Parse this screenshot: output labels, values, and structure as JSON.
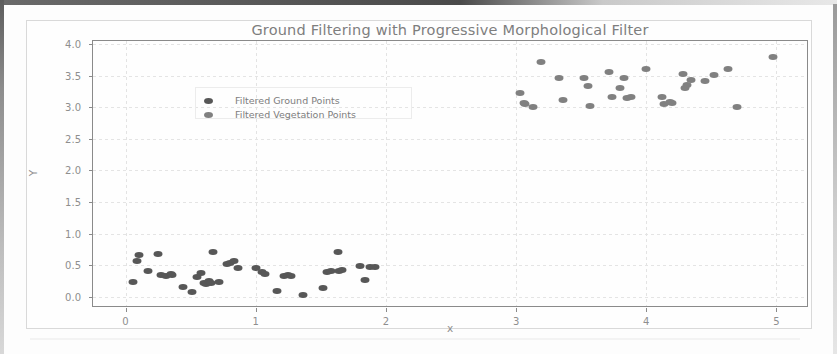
{
  "chart_data": {
    "type": "scatter",
    "title": "Ground Filtering with Progressive Morphological Filter",
    "xlabel": "x",
    "ylabel": "Y",
    "xlim": [
      -0.25,
      5.25
    ],
    "ylim": [
      -0.18,
      4.05
    ],
    "xticks": [
      "0",
      "1",
      "2",
      "3",
      "4",
      "5"
    ],
    "xtick_values": [
      0,
      1,
      2,
      3,
      4,
      5
    ],
    "yticks": [
      "0.0",
      "0.5",
      "1.0",
      "1.5",
      "2.0",
      "2.5",
      "3.0",
      "3.5",
      "4.0"
    ],
    "ytick_values": [
      0.0,
      0.5,
      1.0,
      1.5,
      2.0,
      2.5,
      3.0,
      3.5,
      4.0
    ],
    "grid": true,
    "legend_position": "upper left",
    "series": [
      {
        "name": "Filtered Ground Points",
        "color": "#575757",
        "marker": "circle",
        "points": [
          [
            0.06,
            0.23
          ],
          [
            0.09,
            0.57
          ],
          [
            0.1,
            0.66
          ],
          [
            0.17,
            0.4
          ],
          [
            0.25,
            0.67
          ],
          [
            0.27,
            0.34
          ],
          [
            0.31,
            0.33
          ],
          [
            0.35,
            0.36
          ],
          [
            0.36,
            0.35
          ],
          [
            0.44,
            0.16
          ],
          [
            0.51,
            0.08
          ],
          [
            0.55,
            0.31
          ],
          [
            0.58,
            0.37
          ],
          [
            0.6,
            0.22
          ],
          [
            0.62,
            0.2
          ],
          [
            0.64,
            0.24
          ],
          [
            0.66,
            0.22
          ],
          [
            0.67,
            0.7
          ],
          [
            0.72,
            0.23
          ],
          [
            0.78,
            0.52
          ],
          [
            0.8,
            0.53
          ],
          [
            0.83,
            0.57
          ],
          [
            0.86,
            0.45
          ],
          [
            1.0,
            0.46
          ],
          [
            1.05,
            0.39
          ],
          [
            1.07,
            0.36
          ],
          [
            1.16,
            0.09
          ],
          [
            1.22,
            0.33
          ],
          [
            1.25,
            0.35
          ],
          [
            1.27,
            0.32
          ],
          [
            1.36,
            0.02
          ],
          [
            1.52,
            0.14
          ],
          [
            1.55,
            0.39
          ],
          [
            1.58,
            0.41
          ],
          [
            1.63,
            0.71
          ],
          [
            1.64,
            0.4
          ],
          [
            1.66,
            0.42
          ],
          [
            1.8,
            0.48
          ],
          [
            1.84,
            0.27
          ],
          [
            1.88,
            0.47
          ],
          [
            1.92,
            0.47
          ]
        ]
      },
      {
        "name": "Filtered Vegetation Points",
        "color": "#808080",
        "marker": "circle",
        "points": [
          [
            3.03,
            3.22
          ],
          [
            3.06,
            3.06
          ],
          [
            3.07,
            3.05
          ],
          [
            3.13,
            3.01
          ],
          [
            3.19,
            3.71
          ],
          [
            3.33,
            3.47
          ],
          [
            3.36,
            3.12
          ],
          [
            3.52,
            3.46
          ],
          [
            3.55,
            3.33
          ],
          [
            3.57,
            3.02
          ],
          [
            3.71,
            3.56
          ],
          [
            3.74,
            3.17
          ],
          [
            3.8,
            3.31
          ],
          [
            3.83,
            3.47
          ],
          [
            3.85,
            3.15
          ],
          [
            3.88,
            3.17
          ],
          [
            4.0,
            3.61
          ],
          [
            4.12,
            3.16
          ],
          [
            4.14,
            3.05
          ],
          [
            4.18,
            3.09
          ],
          [
            4.2,
            3.07
          ],
          [
            4.28,
            3.53
          ],
          [
            4.3,
            3.3
          ],
          [
            4.31,
            3.35
          ],
          [
            4.34,
            3.44
          ],
          [
            4.45,
            3.41
          ],
          [
            4.52,
            3.51
          ],
          [
            4.63,
            3.6
          ],
          [
            4.7,
            3.01
          ],
          [
            4.97,
            3.79
          ]
        ]
      }
    ]
  }
}
